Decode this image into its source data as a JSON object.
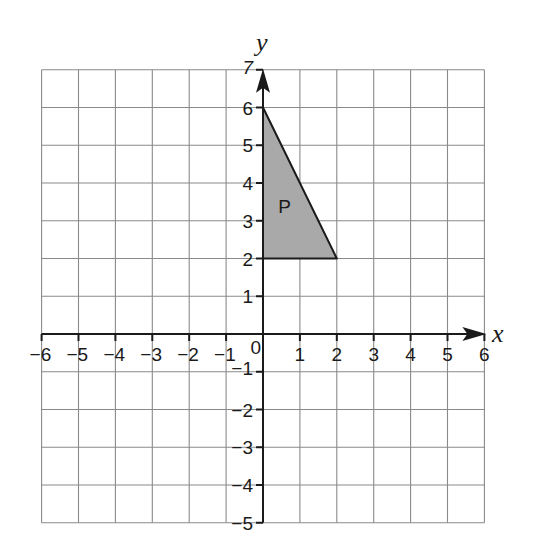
{
  "chart_data": {
    "type": "coordinate-grid",
    "x_axis": {
      "label": "x",
      "min": -6,
      "max": 6,
      "ticks": [
        "-6",
        "-5",
        "-4",
        "-3",
        "-2",
        "-1",
        "0",
        "1",
        "2",
        "3",
        "4",
        "5",
        "6"
      ]
    },
    "y_axis": {
      "label": "y",
      "min": -5,
      "max": 7,
      "ticks": [
        "-5",
        "-4",
        "-3",
        "-2",
        "-1",
        "1",
        "2",
        "3",
        "4",
        "5",
        "6",
        "7"
      ]
    },
    "grid": true,
    "shapes": [
      {
        "name": "P",
        "type": "triangle",
        "vertices": [
          [
            0,
            6
          ],
          [
            0,
            2
          ],
          [
            2,
            2
          ]
        ],
        "fill": "#a9a9a9",
        "label_pos": [
          0.6,
          3.4
        ]
      }
    ]
  },
  "labels": {
    "x_axis_title": "x",
    "y_axis_title": "y",
    "origin": "0",
    "shape_p": "P"
  },
  "colors": {
    "grid": "#8a8a8a",
    "axis": "#1a1a1a",
    "shape_fill": "#a9a9a9"
  }
}
